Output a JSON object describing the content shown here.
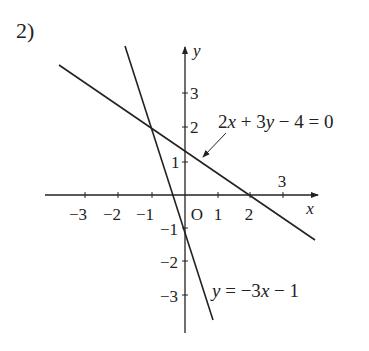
{
  "problem_number": "2)",
  "axes": {
    "x_label": "x",
    "y_label": "y",
    "origin_label": "O",
    "x_ticks": [
      "−3",
      "−2",
      "−1",
      "1",
      "2",
      "3"
    ],
    "y_ticks": [
      "3",
      "2",
      "1",
      "−1",
      "−2",
      "−3"
    ]
  },
  "lines": [
    {
      "name": "line-1",
      "equation": "2x + 3y − 4 = 0",
      "label_parts": [
        "2",
        "x",
        " + 3",
        "y",
        " − 4 = 0"
      ],
      "x_intercept": 2,
      "y_intercept": "4/3"
    },
    {
      "name": "line-2",
      "equation": "y = −3x − 1",
      "label_parts": [
        "y",
        " = −3",
        "x",
        " − 1"
      ],
      "x_intercept": "-1/3",
      "y_intercept": -1
    }
  ],
  "intersection": {
    "x": -1,
    "y": 2
  },
  "colors": {
    "stroke": "#222222",
    "background": "#ffffff"
  }
}
